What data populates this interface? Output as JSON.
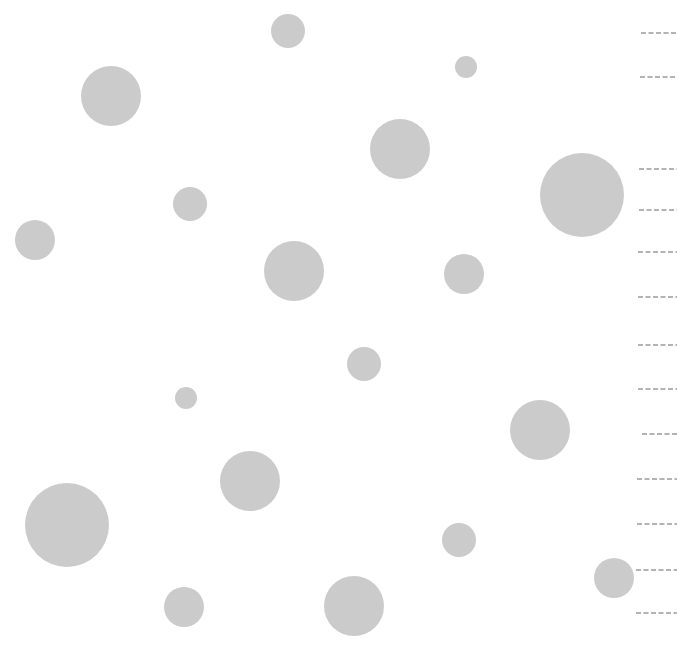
{
  "canvas": {
    "width": 677,
    "height": 645,
    "background": "#ffffff"
  },
  "circle_color": "#cbcbcb",
  "dash_color": "#9a9a9a",
  "circles": [
    {
      "cx": 288,
      "cy": 31,
      "r": 17
    },
    {
      "cx": 111,
      "cy": 96,
      "r": 30
    },
    {
      "cx": 466,
      "cy": 67,
      "r": 11
    },
    {
      "cx": 400,
      "cy": 149,
      "r": 30
    },
    {
      "cx": 582,
      "cy": 195,
      "r": 42
    },
    {
      "cx": 190,
      "cy": 204,
      "r": 17
    },
    {
      "cx": 35,
      "cy": 240,
      "r": 20
    },
    {
      "cx": 294,
      "cy": 271,
      "r": 30
    },
    {
      "cx": 464,
      "cy": 274,
      "r": 20
    },
    {
      "cx": 364,
      "cy": 364,
      "r": 17
    },
    {
      "cx": 186,
      "cy": 398,
      "r": 11
    },
    {
      "cx": 540,
      "cy": 430,
      "r": 30
    },
    {
      "cx": 250,
      "cy": 481,
      "r": 30
    },
    {
      "cx": 67,
      "cy": 525,
      "r": 42
    },
    {
      "cx": 459,
      "cy": 540,
      "r": 17
    },
    {
      "cx": 614,
      "cy": 578,
      "r": 20
    },
    {
      "cx": 184,
      "cy": 607,
      "r": 20
    },
    {
      "cx": 354,
      "cy": 606,
      "r": 30
    }
  ],
  "dashed_lines": [
    {
      "x1": 641,
      "y": 33
    },
    {
      "x1": 640,
      "y": 77
    },
    {
      "x1": 639,
      "y": 169
    },
    {
      "x1": 639,
      "y": 210
    },
    {
      "x1": 638,
      "y": 252
    },
    {
      "x1": 638,
      "y": 297
    },
    {
      "x1": 638,
      "y": 345
    },
    {
      "x1": 638,
      "y": 389
    },
    {
      "x1": 642,
      "y": 434
    },
    {
      "x1": 637,
      "y": 479
    },
    {
      "x1": 637,
      "y": 524
    },
    {
      "x1": 636,
      "y": 570
    },
    {
      "x1": 636,
      "y": 613
    }
  ]
}
